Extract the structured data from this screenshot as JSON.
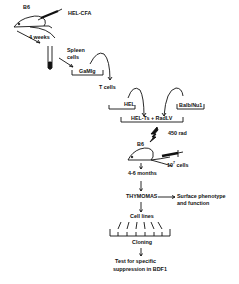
{
  "diagram": {
    "title": "",
    "nodes": {
      "mouse1_strain": "B6",
      "immunogen": "HEL-CFA",
      "interval1": "4 weeks",
      "spleen": "Spleen",
      "spleen2": "cells",
      "panning": "GaMIg",
      "tcells": "T cells",
      "hel": "HEL",
      "balb": "Balb/Nu1",
      "fusion": "HEL-Ts + RadLV",
      "irradiation": "450 rad",
      "mouse2_strain": "B6",
      "cell_dose_base": "10",
      "cell_dose_exp": "7",
      "cell_dose_unit": "cells",
      "interval2": "4-6 months",
      "thymomas": "THYMOMAS",
      "phenotype1": "Surface phenotype",
      "phenotype2": "and function",
      "cell_lines": "Cell lines",
      "cloning": "Cloning",
      "test1": "Test for specific",
      "test2": "suppression in BDF1"
    },
    "colors": {
      "ink": "#111111",
      "background": "#ffffff"
    }
  }
}
